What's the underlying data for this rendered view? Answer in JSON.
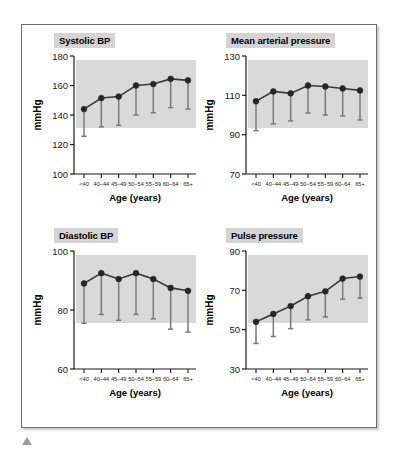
{
  "figure": {
    "marker_caption_icon": "triangle-marker",
    "axis_label_x": "Age (years)",
    "axis_label_y": "mmHg",
    "categories": [
      "<40",
      "40–44",
      "45–49",
      "50–54",
      "55–59",
      "60–64",
      "65+"
    ],
    "colors": {
      "plot_background": "#d9d9d9",
      "line": "#3a3a3a",
      "marker": "#262626",
      "error_bar": "#7a7a7a",
      "title_background": "#d4d4d4",
      "frame_border": "#6e6e6e"
    }
  },
  "chart_data": [
    {
      "type": "line",
      "panel": "top-left",
      "title": "Systolic BP",
      "xlabel": "Age (years)",
      "ylabel": "mmHg",
      "ylim": [
        100,
        180
      ],
      "yticks": [
        100,
        120,
        140,
        160,
        180
      ],
      "grid": false,
      "categories": [
        "<40",
        "40–44",
        "45–49",
        "50–54",
        "55–59",
        "60–64",
        "65+"
      ],
      "values": [
        144,
        151.5,
        152.5,
        160,
        161,
        164.5,
        163.5
      ],
      "error_low": [
        125.5,
        132,
        133,
        140,
        141.5,
        145,
        144
      ],
      "error_bars": "lower-only"
    },
    {
      "type": "line",
      "panel": "top-right",
      "title": "Mean arterial pressure",
      "xlabel": "Age (years)",
      "ylabel": "mmHg",
      "ylim": [
        70,
        130
      ],
      "yticks": [
        70,
        90,
        110,
        130
      ],
      "grid": false,
      "categories": [
        "<40",
        "40–44",
        "45–49",
        "50–54",
        "55–59",
        "60–64",
        "65+"
      ],
      "values": [
        107,
        112,
        111,
        115,
        114.5,
        113.5,
        112.5
      ],
      "error_low": [
        92,
        95.5,
        97,
        101,
        100,
        99.5,
        97.5
      ],
      "error_bars": "lower-only"
    },
    {
      "type": "line",
      "panel": "bottom-left",
      "title": "Diastolic BP",
      "xlabel": "Age (years)",
      "ylabel": "mmHg",
      "ylim": [
        60,
        100
      ],
      "yticks": [
        60,
        80,
        100
      ],
      "grid": false,
      "categories": [
        "<40",
        "40–44",
        "45–49",
        "50–54",
        "55–59",
        "60–64",
        "65+"
      ],
      "values": [
        89,
        92.5,
        90.5,
        92.5,
        90.5,
        87.5,
        86.5
      ],
      "error_low": [
        75.5,
        78.5,
        76.5,
        78.5,
        77,
        73.5,
        72.5
      ],
      "error_bars": "lower-only"
    },
    {
      "type": "line",
      "panel": "bottom-right",
      "title": "Pulse pressure",
      "xlabel": "Age (years)",
      "ylabel": "mmHg",
      "ylim": [
        30,
        90
      ],
      "yticks": [
        30,
        50,
        70,
        90
      ],
      "grid": false,
      "categories": [
        "<40",
        "40–44",
        "45–49",
        "50–54",
        "55–59",
        "60–64",
        "65+"
      ],
      "values": [
        54,
        58,
        62,
        67,
        69.5,
        76,
        77
      ],
      "error_low": [
        43,
        46.5,
        50.5,
        55,
        56.5,
        65.5,
        66
      ],
      "error_bars": "lower-only"
    }
  ]
}
